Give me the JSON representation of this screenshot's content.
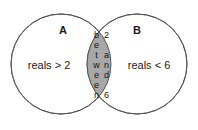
{
  "diagram": {
    "type": "venn-diagram",
    "background_color": "#ffffff",
    "stroke_color": "#555555",
    "intersection_fill": "#a8a8a8",
    "text_color": "#1a1a1a",
    "sets": [
      {
        "label": "A",
        "description": "reals > 2"
      },
      {
        "label": "B",
        "description": "reals < 6"
      }
    ],
    "intersection": {
      "line_1": "between",
      "line_2": "2 and 6"
    }
  }
}
